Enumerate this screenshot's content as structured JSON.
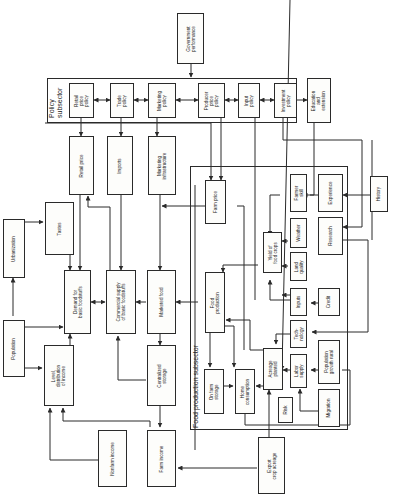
{
  "diagram": {
    "orientation": "rotated 90° counter-clockwise",
    "subsystems": {
      "policy": "Policy\nsubsector",
      "food_production": "Food production subsector"
    },
    "nodes": {
      "government_performance": "Government\nperformance",
      "retail_price_policy": "Retail\nprice\npolicy",
      "trade_policy": "Trade\npolicy",
      "marketing_policy": "Marketing\npolicy",
      "producer_price_policy": "Producer\nprice\npolicy",
      "input_policy": "Input\npolicy",
      "investment_policy": "Investment\npolicy",
      "education_extension": "Education\nand\nextension",
      "retail_price": "Retail price",
      "imports": "Imports",
      "marketing_infrastructure": "Marketing\ninfrastructure",
      "farm_price": "Farm price",
      "farmer_skill": "Farmer\nskill",
      "experience": "Experience",
      "history": "History",
      "research": "Research",
      "weather": "Weather",
      "yield_food_crops": "Yield of\nfood crops",
      "land_quality": "Land\nquality",
      "inputs": "Inputs",
      "credit": "Credit",
      "technology": "Tech-\nnology",
      "urbanization": "Urbanization",
      "tastes": "Tastes",
      "demand_basic_foodstuffs": "Demand for\nbasic foodstuffs",
      "commercial_supply": "Commercial supply\nof basic foodstuffs",
      "marketed_food": "Marketed food",
      "food_production": "Food\nproduction",
      "population": "Population",
      "level_distribution_income": "Level,\ndistribution\nof income",
      "centralized_storage": "Centralized\nstorage",
      "on_farm_storage": "On farm\nstorage",
      "home_consumption": "Home\nconsumption",
      "acreage_planted": "Acreage\nplanted",
      "labor_supply": "Labor\nsupply",
      "population_growth_rural": "Population\ngrowth rural",
      "risk": "Risk",
      "migration": "Migration",
      "nonfarm_income": "Nonfarm income",
      "farm_income": "Farm income",
      "export_crop_acreage": "Export\ncrop acreage"
    }
  }
}
